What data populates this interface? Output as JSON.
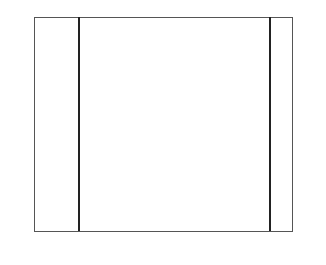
{
  "chart": {
    "columns": 23,
    "rows": 19,
    "colors": {
      "light": "#e3e3e3",
      "medium": "#b9b9b9",
      "dark": "#7c7c7c",
      "purl": "#ececec"
    },
    "legend": {
      "P": "purl stitch (dot)",
      "L": "light",
      "M": "medium gray",
      "D": "dark gray"
    },
    "left_row_labels": [
      "18",
      "16",
      "14",
      "12",
      "10",
      "8",
      "6",
      "4",
      "2"
    ],
    "right_row_labels": [
      "19",
      "17",
      "15",
      "13",
      "11",
      "9",
      "7",
      "5",
      "3",
      "1"
    ],
    "bottom_col_labels": [
      "23",
      "21",
      "19",
      "17",
      "15",
      "13",
      "11",
      "9",
      "7",
      "5",
      "3",
      "1"
    ],
    "grid_rows_top_to_bottom": [
      "PPLLLLLLLLLLLLLLLLLLLPP",
      "PPLLLLLLLLLLLLLLLLLLLPP",
      "PPLLLLLLMMMMMMLLLLLLLPP",
      "PPLLLLLMMMMMMMMMLLLLLPP",
      "PPLLLLMMMMMMMMMMMLLLLPP",
      "PPLLMLMMLMMMLMMMMLLLLPP",
      "PPLLMMLLMMMLLMMMLMMLLPP",
      "PPLLMMMMLMMMMMLMMMLLLPP",
      "PPLLMMMLLMDDDLLMMMMLLPP",
      "PPLLMMLMMDDMDDLLMMMLLPP",
      "PPLLMMMMMMDDDLMMMMMLLPP",
      "PPLLMMMLLLDDDLLMMMLLLPP",
      "PPLLLMMMLLLLLLLMMMMLLPP",
      "PPLLLMLLMMLLLMMLLMMLLPP",
      "PPLLMLLLMMMLLMMMLLLLLPP",
      "PPLLLLLMMMMMMMMLLLLLLPP",
      "PPLLLLLLMLMMMMMLLLLLLPP",
      "PPLLLLLLLLLLLLLLLLLLLPP",
      "PPLLLLLLLLLLLLLLLLLLLPP"
    ]
  }
}
